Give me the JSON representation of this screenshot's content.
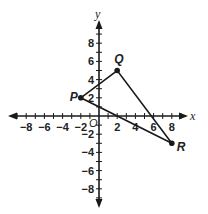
{
  "axes": {
    "x_label": "x",
    "y_label": "y",
    "origin_label": "O",
    "x_ticks": [
      {
        "value": -8,
        "label": "−8"
      },
      {
        "value": -6,
        "label": "−6"
      },
      {
        "value": -4,
        "label": "−4"
      },
      {
        "value": -2,
        "label": "−2"
      },
      {
        "value": 2,
        "label": "2"
      },
      {
        "value": 4,
        "label": "4"
      },
      {
        "value": 6,
        "label": "6"
      },
      {
        "value": 8,
        "label": "8"
      }
    ],
    "y_ticks": [
      {
        "value": 8,
        "label": "8"
      },
      {
        "value": 6,
        "label": "6"
      },
      {
        "value": 4,
        "label": "4"
      },
      {
        "value": 2,
        "label": "2"
      },
      {
        "value": -2,
        "label": "−2"
      },
      {
        "value": -4,
        "label": "−4"
      },
      {
        "value": -6,
        "label": "−6"
      },
      {
        "value": -8,
        "label": "−8"
      }
    ],
    "range": [
      -9,
      9
    ]
  },
  "triangle": {
    "vertices": [
      {
        "name": "P",
        "x": -2,
        "y": 2
      },
      {
        "name": "Q",
        "x": 2,
        "y": 5
      },
      {
        "name": "R",
        "x": 8,
        "y": -3
      }
    ]
  },
  "colors": {
    "stroke": "#1a1a1a",
    "background": "#ffffff"
  }
}
